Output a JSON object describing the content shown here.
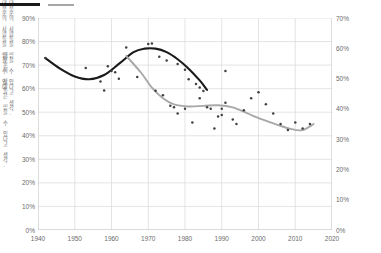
{
  "legend": {
    "items": [
      {
        "name": "fitted-trend-black",
        "label": "",
        "color": "#1a1a1a"
      },
      {
        "name": "fitted-trend-gray",
        "label": "",
        "color": "#a6a6a6"
      }
    ]
  },
  "axes": {
    "y_left": {
      "title": "대부분의 사람들은 믿을 수 있다고 생각.",
      "ticks": [
        "0%",
        "10%",
        "20%",
        "30%",
        "40%",
        "50%",
        "60%",
        "70%",
        "80%",
        "90%"
      ],
      "min": 0,
      "max": 90
    },
    "y_right": {
      "title_line1": "대부분의 사람들을 믿을 수 있다고 생각.",
      "title_line2": "대부분의 사람들을 믿을 수 있다.",
      "ticks": [
        "0%",
        "10%",
        "20%",
        "30%",
        "40%",
        "50%",
        "60%",
        "70%"
      ],
      "min": 0,
      "max": 70
    },
    "x": {
      "ticks": [
        "1940",
        "1950",
        "1960",
        "1970",
        "1980",
        "1990",
        "2000",
        "2010",
        "2020"
      ],
      "min": 1940,
      "max": 2020
    }
  },
  "colors": {
    "series_black": "#1a1a1a",
    "series_gray": "#a8a8a8",
    "point": "#404040",
    "grid": "#d9d9d9",
    "axis": "#bfbfbf",
    "text": "#6b6b6b",
    "background": "#ffffff"
  },
  "chart_data": {
    "type": "scatter",
    "title": "",
    "subtitle": "",
    "xlabel": "",
    "ylabel": "대부분의 사람들은 믿을 수 있다고 생각.",
    "ylabel_right": "대부분의 사람들을 믿을 수 있다고 생각.",
    "xlim": [
      1940,
      2020
    ],
    "ylim": [
      0,
      90
    ],
    "ylim_right": [
      0,
      70
    ],
    "grid": true,
    "legend_position": "top-left",
    "series": [
      {
        "name": "trust-black-points",
        "axis": "left",
        "type": "scatter",
        "color": "#404040",
        "points": [
          [
            1942,
            73.0
          ],
          [
            1953,
            68.8
          ],
          [
            1957,
            63.0
          ],
          [
            1958,
            59.2
          ],
          [
            1959,
            69.5
          ],
          [
            1960,
            67.5
          ],
          [
            1961,
            67.0
          ],
          [
            1962,
            64.2
          ],
          [
            1964,
            77.5
          ],
          [
            1967,
            65.0
          ],
          [
            1970,
            79.0
          ],
          [
            1971,
            79.2
          ],
          [
            1973,
            73.5
          ],
          [
            1975,
            72.0
          ],
          [
            1978,
            70.5
          ],
          [
            1980,
            68.0
          ],
          [
            1981,
            64.0
          ],
          [
            1983,
            62.0
          ],
          [
            1984,
            60.5
          ],
          [
            1985,
            59.0
          ],
          [
            1987,
            51.5
          ],
          [
            1990,
            51.5
          ],
          [
            1991,
            67.5
          ]
        ]
      },
      {
        "name": "trust-black-fit",
        "axis": "left",
        "type": "line",
        "color": "#1a1a1a",
        "points": [
          [
            1942,
            73.0
          ],
          [
            1946,
            68.5
          ],
          [
            1950,
            65.2
          ],
          [
            1954,
            64.0
          ],
          [
            1958,
            65.8
          ],
          [
            1962,
            70.5
          ],
          [
            1966,
            75.5
          ],
          [
            1969,
            77.0
          ],
          [
            1972,
            77.0
          ],
          [
            1975,
            75.5
          ],
          [
            1978,
            72.5
          ],
          [
            1981,
            68.5
          ],
          [
            1984,
            63.5
          ],
          [
            1986,
            59.5
          ]
        ]
      },
      {
        "name": "trust-gray-points",
        "axis": "right",
        "type": "scatter",
        "color": "#404040",
        "points": [
          [
            1972,
            46.0
          ],
          [
            1974,
            44.5
          ],
          [
            1976,
            41.0
          ],
          [
            1977,
            40.5
          ],
          [
            1978,
            38.5
          ],
          [
            1980,
            40.0
          ],
          [
            1982,
            35.5
          ],
          [
            1984,
            43.5
          ],
          [
            1986,
            40.5
          ],
          [
            1988,
            33.5
          ],
          [
            1989,
            37.5
          ],
          [
            1990,
            38.0
          ],
          [
            1991,
            42.0
          ],
          [
            1993,
            36.5
          ],
          [
            1994,
            35.0
          ],
          [
            1996,
            39.5
          ],
          [
            1998,
            43.5
          ],
          [
            2000,
            45.5
          ],
          [
            2002,
            41.5
          ],
          [
            2004,
            38.5
          ],
          [
            2006,
            35.0
          ],
          [
            2008,
            33.0
          ],
          [
            2010,
            35.5
          ],
          [
            2012,
            33.5
          ],
          [
            2014,
            35.0
          ]
        ]
      },
      {
        "name": "trust-gray-fit",
        "axis": "right",
        "type": "line",
        "color": "#a8a8a8",
        "points": [
          [
            1964,
            57.5
          ],
          [
            1968,
            52.0
          ],
          [
            1971,
            47.0
          ],
          [
            1974,
            43.5
          ],
          [
            1977,
            41.5
          ],
          [
            1981,
            40.8
          ],
          [
            1985,
            41.0
          ],
          [
            1989,
            41.2
          ],
          [
            1993,
            40.5
          ],
          [
            1997,
            38.5
          ],
          [
            2001,
            36.5
          ],
          [
            2005,
            34.8
          ],
          [
            2009,
            33.3
          ],
          [
            2012,
            33.0
          ],
          [
            2015,
            35.0
          ]
        ]
      }
    ]
  }
}
